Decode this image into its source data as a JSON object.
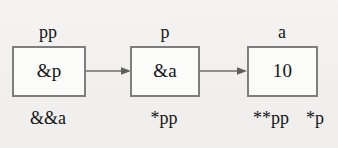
{
  "diagram": {
    "background_color": "#f1f0ee",
    "border_color": "#7e7e7e",
    "text_color": "#141414",
    "arrow_color": "#6f6f6f",
    "nodes": [
      {
        "id": "node-pp",
        "top_label": "pp",
        "value": "&p",
        "bottom_labels": [
          "&&a"
        ]
      },
      {
        "id": "node-p",
        "top_label": "p",
        "value": "&a",
        "bottom_labels": [
          "*pp"
        ]
      },
      {
        "id": "node-a",
        "top_label": "a",
        "value": "10",
        "bottom_labels": [
          "**pp",
          "*p"
        ]
      }
    ],
    "arrows": [
      {
        "id": "arrow-pp-to-p",
        "from": "node-pp",
        "to": "node-p"
      },
      {
        "id": "arrow-p-to-a",
        "from": "node-p",
        "to": "node-a"
      }
    ]
  }
}
